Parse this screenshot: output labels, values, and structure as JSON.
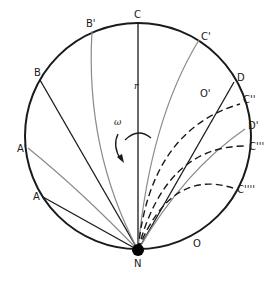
{
  "diagram": {
    "type": "circular-geometry-diagram",
    "circle": {
      "center": [
        138,
        136
      ],
      "radius": 113,
      "stroke": "#1a1a1a"
    },
    "center_point_label": "O'",
    "outer_label": "O",
    "pole_label": "N",
    "radius_label": "r",
    "rotation_label": "ω",
    "points": {
      "C": "C",
      "C1": "C'",
      "C2": "C''",
      "C3": "C'''",
      "C4": "C''''",
      "B": "B",
      "B1": "B'",
      "A": "A",
      "A1": "A'",
      "D": "D",
      "D1": "D'"
    },
    "colors": {
      "dark_line": "#1a1a1a",
      "gray_line": "#8a8a8a",
      "background": "#ffffff"
    }
  }
}
